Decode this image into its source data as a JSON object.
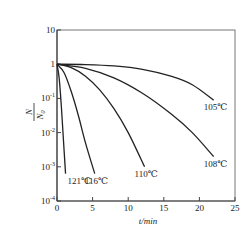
{
  "chart_data": {
    "type": "line",
    "title": "",
    "xlabel": "t/min",
    "ylabel_num": "N",
    "ylabel_den": "N",
    "ylabel_den_sub": "0",
    "xlim": [
      0,
      25
    ],
    "ylim_log10": [
      -4,
      1
    ],
    "yscale": "log",
    "grid": false,
    "x_ticks": [
      0,
      5,
      10,
      15,
      20,
      25
    ],
    "x_tick_labels": [
      "0",
      "5",
      "10",
      "15",
      "20",
      "25"
    ],
    "y_ticks_log10": [
      1,
      0,
      -1,
      -2,
      -3,
      -4
    ],
    "y_tick_labels": [
      {
        "base": "10",
        "exp": ""
      },
      {
        "base": "1",
        "exp": ""
      },
      {
        "base": "10",
        "exp": "-1"
      },
      {
        "base": "10",
        "exp": "-2"
      },
      {
        "base": "10",
        "exp": "-3"
      },
      {
        "base": "10",
        "exp": "-4"
      }
    ],
    "series": [
      {
        "name": "121℃",
        "x": [
          0,
          0.3,
          0.6,
          0.9,
          1.2
        ],
        "log10_y": [
          0,
          -0.4,
          -1.2,
          -2.2,
          -3.2
        ]
      },
      {
        "name": "116℃",
        "x": [
          0,
          1,
          2,
          3,
          4,
          5.3
        ],
        "log10_y": [
          0,
          -0.25,
          -0.8,
          -1.5,
          -2.3,
          -3.2
        ]
      },
      {
        "name": "110℃",
        "x": [
          0,
          2,
          4,
          6,
          8,
          10,
          12.3
        ],
        "log10_y": [
          0,
          -0.1,
          -0.35,
          -0.75,
          -1.3,
          -2.0,
          -3.0
        ]
      },
      {
        "name": "108℃",
        "x": [
          0,
          4,
          8,
          12,
          16,
          19,
          22
        ],
        "log10_y": [
          0,
          -0.12,
          -0.4,
          -0.85,
          -1.45,
          -2.0,
          -2.7
        ]
      },
      {
        "name": "105℃",
        "x": [
          0,
          4,
          8,
          12,
          16,
          19,
          22
        ],
        "log10_y": [
          0,
          -0.01,
          -0.05,
          -0.15,
          -0.35,
          -0.6,
          -1.05
        ]
      }
    ]
  }
}
